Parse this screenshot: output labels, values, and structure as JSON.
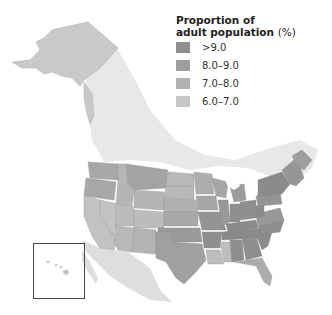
{
  "legend": {
    "title_line1": "Proportion of",
    "title_line2": "adult population",
    "unit": "(%)",
    "items": [
      {
        "label": ">9.0",
        "color": "#8e8e8e"
      },
      {
        "label": "8.0–9.0",
        "color": "#9e9e9e"
      },
      {
        "label": "7.0–8.0",
        "color": "#b1b1b1"
      },
      {
        "label": "6.0–7.0",
        "color": "#c6c6c6"
      }
    ]
  },
  "map": {
    "region": "United States by state",
    "inset": "Hawaii",
    "background_land_color": "#e4e4e4",
    "alaska_color": "#c8c8c8"
  }
}
